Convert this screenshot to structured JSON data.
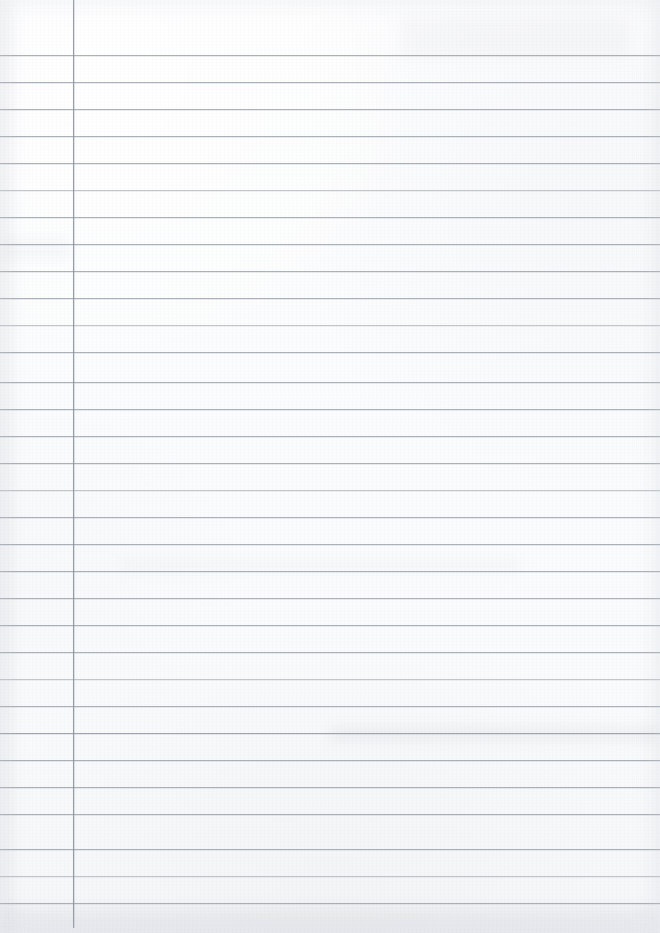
{
  "document": {
    "kind": "scanned-blank-ruled-notebook-page",
    "title": "Blank Ruled Notebook Page",
    "written_content": "",
    "page_width_px": 660,
    "page_height_px": 933,
    "paper_color": "#fcfcfd",
    "paper_color_bottom": "#f7f8fa"
  },
  "ruling": {
    "style": "wide-ruled-with-left-margin",
    "line_color": "#9aa1aa",
    "line_thickness_px": 1,
    "line_spacing_px": 27,
    "first_line_y_px": 55,
    "last_line_y_px": 903,
    "line_count": 32,
    "line_start_x_px": 0,
    "line_end_x_px": 660,
    "line_y_positions": [
      55,
      82,
      109,
      136,
      163,
      190,
      217,
      244,
      271,
      298,
      325,
      352,
      382,
      409,
      436,
      463,
      490,
      517,
      544,
      571,
      598,
      625,
      652,
      679,
      706,
      733,
      760,
      787,
      814,
      849,
      876,
      903
    ],
    "line_weights": [
      "normal",
      "normal",
      "normal",
      "normal",
      "normal",
      "faint",
      "normal",
      "normal",
      "normal",
      "normal",
      "faint",
      "normal",
      "normal",
      "normal",
      "normal",
      "normal",
      "faint",
      "normal",
      "normal",
      "normal",
      "normal",
      "normal",
      "normal",
      "faint",
      "normal",
      "strong",
      "normal",
      "normal",
      "normal",
      "normal",
      "faint",
      "normal"
    ]
  },
  "margin_rule": {
    "orientation": "vertical",
    "color": "#8d949e",
    "thickness_px": 1,
    "x_px": 73,
    "top_y_px": 0,
    "bottom_y_px": 928
  },
  "artifacts": {
    "smudges": [
      {
        "name": "upper-right-haze",
        "x_px": 400,
        "y_px": 18,
        "width_px": 230,
        "height_px": 40,
        "opacity": 0.05
      },
      {
        "name": "mid-left-blotch",
        "x_px": 0,
        "y_px": 238,
        "width_px": 70,
        "height_px": 22,
        "opacity": 0.06
      },
      {
        "name": "center-band",
        "x_px": 120,
        "y_px": 556,
        "width_px": 400,
        "height_px": 18,
        "opacity": 0.04
      },
      {
        "name": "lower-right-streak",
        "x_px": 330,
        "y_px": 727,
        "width_px": 330,
        "height_px": 14,
        "opacity": 0.1
      },
      {
        "name": "bottom-edge-shadow",
        "x_px": 0,
        "y_px": 905,
        "width_px": 660,
        "height_px": 28,
        "opacity": 0.09
      },
      {
        "name": "left-edge-shadow",
        "x_px": 0,
        "y_px": 0,
        "width_px": 14,
        "height_px": 933,
        "opacity": 0.05
      }
    ]
  }
}
